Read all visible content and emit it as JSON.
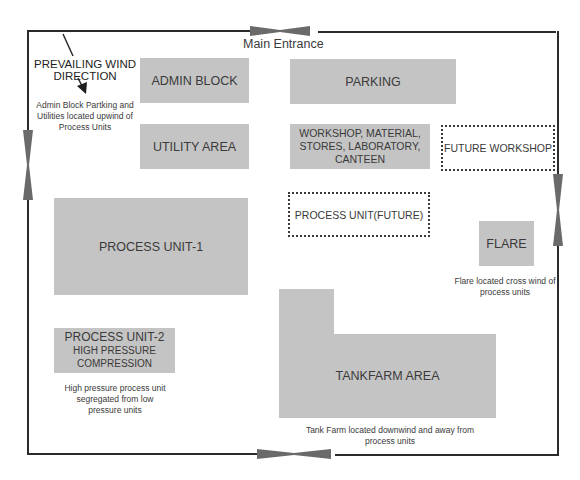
{
  "diagram": {
    "type": "plant-layout",
    "boundary": {
      "label": "site-boundary-road"
    },
    "entrance": {
      "label": "Main Entrance"
    },
    "wind": {
      "title_line1": "PREVAILING WIND",
      "title_line2": "DIRECTION",
      "note_line1": "Admin Block Partking and",
      "note_line2": "Utilities located upwind of",
      "note_line3": "Process Units"
    },
    "areas": {
      "admin_block": "ADMIN BLOCK",
      "parking": "PARKING",
      "utility_area": "UTILITY AREA",
      "workshop_line1": "WORKSHOP, MATERIAL,",
      "workshop_line2": "STORES, LABORATORY,",
      "workshop_line3": "CANTEEN",
      "future_workshop": "FUTURE WORKSHOP",
      "process_unit_future": "PROCESS UNIT(FUTURE)",
      "process_unit_1": "PROCESS UNIT-1",
      "flare": "FLARE",
      "process_unit_2_line1": "PROCESS UNIT-2",
      "process_unit_2_line2": "HIGH PRESSURE",
      "process_unit_2_line3": "COMPRESSION",
      "tankfarm": "TANKFARM AREA"
    },
    "notes": {
      "flare_line1": "Flare located cross wind of",
      "flare_line2": "process units",
      "pu2_line1": "High pressure process unit",
      "pu2_line2": "segregated from low",
      "pu2_line3": "pressure units",
      "tank_line1": "Tank Farm located downwind and away from",
      "tank_line2": "process units"
    },
    "colors": {
      "area_fill": "#c4c4c4",
      "line": "#2b2b2b",
      "gate": "#6a6a6a"
    }
  }
}
